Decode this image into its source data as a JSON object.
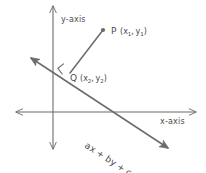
{
  "figure": {
    "background_color": "#ffffff",
    "stroke_color": "#6b6b6b",
    "text_color": "#4a4a4a",
    "axes": {
      "x_label": "x-axis",
      "y_label": "y-axis",
      "origin": {
        "x": 53,
        "y": 112
      },
      "x_start": {
        "x": 16,
        "y": 112
      },
      "x_end": {
        "x": 196,
        "y": 112
      },
      "y_start": {
        "x": 53,
        "y": 6
      },
      "y_end": {
        "x": 53,
        "y": 149
      }
    },
    "line": {
      "equation": "ax + by + c = 0",
      "equation_parts": {
        "a_term": "ax",
        "plus_1": "+",
        "b_term": "by",
        "plus_2": "+",
        "c_term": "c",
        "equals": "=",
        "rhs": "0"
      },
      "start": {
        "x": 31,
        "y": 58
      },
      "end": {
        "x": 168,
        "y": 148
      },
      "label_rotation_deg": 33
    },
    "points": [
      {
        "id": "P",
        "label": "P",
        "coord_open": "(",
        "coord_x": "x",
        "coord_x_sub": "1",
        "coord_comma": ",",
        "coord_y": "y",
        "coord_y_sub": "1",
        "coord_close": ")",
        "dot": {
          "x": 103,
          "y": 30
        },
        "label_pos": {
          "x": 111,
          "y": 34
        },
        "has_dot": true
      },
      {
        "id": "Q",
        "label": "Q",
        "coord_open": "(",
        "coord_x": "x",
        "coord_x_sub": "2",
        "coord_comma": ",",
        "coord_y": "y",
        "coord_y_sub": "2",
        "coord_close": ")",
        "dot": {
          "x": 70,
          "y": 73
        },
        "label_pos": {
          "x": 72,
          "y": 81
        },
        "has_dot": false
      }
    ],
    "segment_pq": {
      "from": {
        "x": 103,
        "y": 30
      },
      "to": {
        "x": 70,
        "y": 73
      }
    },
    "right_angle_marker": {
      "present": true,
      "size": 8,
      "at": {
        "x": 70,
        "y": 73
      }
    }
  }
}
